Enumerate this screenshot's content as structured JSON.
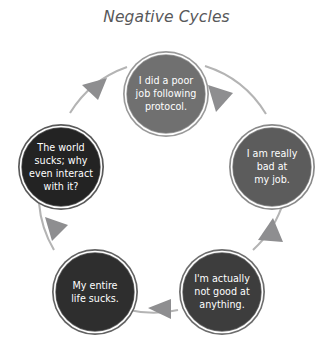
{
  "title": "Negative Cycles",
  "diagram": {
    "type": "cycle",
    "direction": "clockwise",
    "node_count": 5,
    "background_color": "#ffffff",
    "title_color": "#58585a",
    "arc_color": "#b4b4b4",
    "arrow_color": "#8e8e90",
    "node_ring_color": "#ffffff",
    "node_text_color": "#ffffff",
    "nodes": [
      {
        "id": "node-top",
        "position": "top",
        "fill": "#707070",
        "rim": "#9a9a9a",
        "lines": [
          "I did a poor",
          "job following",
          "protocol."
        ],
        "text": "I did a poor job following protocol."
      },
      {
        "id": "node-right",
        "position": "right",
        "fill": "#5c5c5c",
        "rim": "#8a8a8a",
        "lines": [
          "I am really",
          "bad at",
          "my job."
        ],
        "text": "I am really bad at my job."
      },
      {
        "id": "node-bottom-right",
        "position": "bottom-right",
        "fill": "#3d3d3d",
        "rim": "#6e6e6e",
        "lines": [
          "I'm actually",
          "not good at",
          "anything."
        ],
        "text": "I'm actually not good at anything."
      },
      {
        "id": "node-bottom-left",
        "position": "bottom-left",
        "fill": "#2e2e2e",
        "rim": "#636363",
        "lines": [
          "My entire",
          "life sucks."
        ],
        "text": "My entire life sucks."
      },
      {
        "id": "node-left",
        "position": "left",
        "fill": "#232323",
        "rim": "#5a5a5a",
        "lines": [
          "The world",
          "sucks; why",
          "even interact",
          "with it?"
        ],
        "text": "The world sucks; why even interact with it?"
      }
    ],
    "arrows": [
      {
        "id": "arrow-top-to-right",
        "from": "node-top",
        "to": "node-right"
      },
      {
        "id": "arrow-right-to-bottom-right",
        "from": "node-right",
        "to": "node-bottom-right"
      },
      {
        "id": "arrow-bottom-right-to-bottom-left",
        "from": "node-bottom-right",
        "to": "node-bottom-left"
      },
      {
        "id": "arrow-bottom-left-to-left",
        "from": "node-bottom-left",
        "to": "node-left"
      },
      {
        "id": "arrow-left-to-top",
        "from": "node-left",
        "to": "node-top"
      }
    ]
  }
}
